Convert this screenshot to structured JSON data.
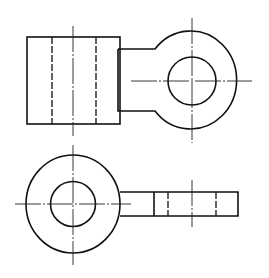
{
  "diagram": {
    "type": "orthographic-projection",
    "colors": {
      "background": "#ffffff",
      "line": "#111111"
    },
    "views": [
      {
        "name": "front-view",
        "body_rect": {
          "x": 27,
          "y": 37,
          "w": 93,
          "h": 87
        },
        "hidden_lines_x": [
          52,
          96
        ],
        "center_line_x": 73,
        "center_line_y_range": [
          26,
          136
        ],
        "arm": {
          "x_start": 118,
          "top_y": 49,
          "bottom_y": 111
        },
        "eye": {
          "cx": 192,
          "cy": 81,
          "outer_rx": 46,
          "outer_ry": 49,
          "inner_r": 24
        },
        "eye_center_lines": {
          "h": [
            131,
            252
          ],
          "v": [
            18,
            143
          ]
        }
      },
      {
        "name": "top-view",
        "eye": {
          "cx": 73,
          "cy": 204,
          "outer_rx": 47,
          "outer_ry": 49,
          "inner_r": 22.5
        },
        "eye_center_lines": {
          "h": [
            15,
            131
          ],
          "v": [
            145,
            265
          ]
        },
        "bar": {
          "x_start": 120,
          "x_end": 238,
          "top_y": 192,
          "bottom_y": 216
        },
        "solid_line_x": 154,
        "hidden_lines_x": [
          168,
          216
        ],
        "bar_center_line": {
          "x": 192,
          "y_range": [
            180,
            227
          ]
        }
      }
    ]
  }
}
